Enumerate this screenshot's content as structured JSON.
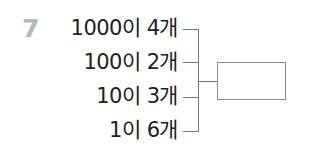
{
  "problem": {
    "number": "7",
    "rows": [
      {
        "text": "1000이 4개"
      },
      {
        "text": "100이 2개"
      },
      {
        "text": "10이 3개"
      },
      {
        "text": "1이 6개"
      }
    ],
    "answer_box": ""
  }
}
